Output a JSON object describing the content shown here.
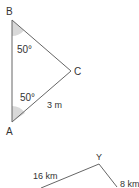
{
  "figure1": {
    "vertices": {
      "A": "A",
      "B": "B",
      "C": "C"
    },
    "angle_B": "50°",
    "angle_A": "50°",
    "side_AC": "3 m"
  },
  "figure2": {
    "vertex": "Y",
    "left_side": "16 km",
    "right_side": "8 km"
  },
  "colors": {
    "line": "#555555",
    "arc_fill": "#d9d9d9",
    "text": "#333333"
  }
}
